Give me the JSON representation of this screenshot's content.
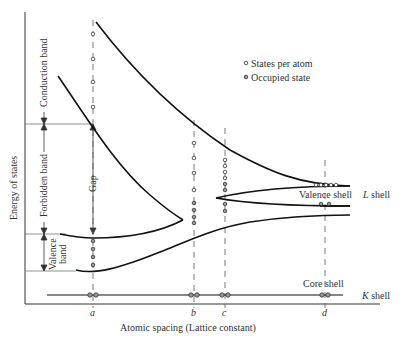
{
  "diagram": {
    "y_axis_label": "Energy of states",
    "x_axis_label": "Atomic spacing (Lattice constant)",
    "x_ticks": [
      "a",
      "b",
      "c",
      "d"
    ],
    "band_labels": {
      "conduction": "Conduction band",
      "forbidden": "Forbidden band",
      "valence": "Valence",
      "valence_2": "band",
      "gap": "Gap"
    },
    "shell_labels": {
      "valence_shell": "Valence shell",
      "core_shell": "Core shell",
      "l_shell_letter": "L",
      "l_shell_word": " shell",
      "k_shell_letter": "K",
      "k_shell_word": " shell"
    },
    "legend": [
      {
        "symbol": "open-circle",
        "label": "States per atom"
      },
      {
        "symbol": "filled-circle",
        "label": "Occupied state"
      }
    ],
    "colors": {
      "line": "#111111",
      "guide": "#777777",
      "text": "#333333"
    }
  }
}
